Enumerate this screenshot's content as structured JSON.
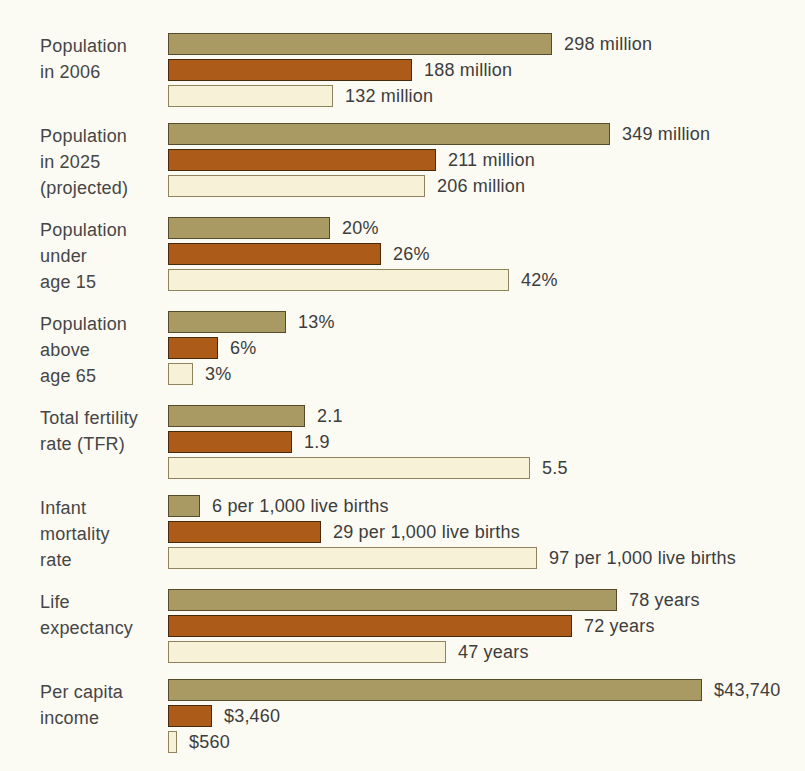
{
  "page": {
    "background_color": "#fbfaf3",
    "text_color": "#414141"
  },
  "series_styles": {
    "olive": {
      "fill": "#a89a62",
      "border": "#564b2b"
    },
    "brown": {
      "fill": "#ac5c18",
      "border": "#472a0c"
    },
    "cream": {
      "fill": "#f7f1d8",
      "border": "#8f835c"
    }
  },
  "chart_data": {
    "type": "bar",
    "orientation": "horizontal",
    "title": "",
    "legend_position": "none",
    "grid": false,
    "axes": "none (values shown as data labels at bar ends)",
    "categories": [
      "Population in 2006",
      "Population in 2025 (projected)",
      "Population under age 15",
      "Population above age 65",
      "Total fertility rate (TFR)",
      "Infant mortality rate",
      "Life expectancy",
      "Per capita income"
    ],
    "series": [
      {
        "name": "olive",
        "color": "#a89a62",
        "values": [
          298,
          349,
          20,
          13,
          2.1,
          6,
          78,
          43740
        ]
      },
      {
        "name": "brown",
        "color": "#ac5c18",
        "values": [
          188,
          211,
          26,
          6,
          1.9,
          29,
          72,
          3460
        ]
      },
      {
        "name": "cream",
        "color": "#f7f1d8",
        "values": [
          132,
          206,
          42,
          3,
          5.5,
          97,
          47,
          560
        ]
      }
    ],
    "groups": [
      {
        "label_lines": [
          "Population",
          "in 2006"
        ],
        "bars": [
          {
            "series": "olive",
            "value": 298,
            "label": "298 million",
            "width_px": 384
          },
          {
            "series": "brown",
            "value": 188,
            "label": "188 million",
            "width_px": 244
          },
          {
            "series": "cream",
            "value": 132,
            "label": "132 million",
            "width_px": 165
          }
        ]
      },
      {
        "label_lines": [
          "Population",
          "in 2025",
          "(projected)"
        ],
        "bars": [
          {
            "series": "olive",
            "value": 349,
            "label": "349 million",
            "width_px": 442
          },
          {
            "series": "brown",
            "value": 211,
            "label": "211 million",
            "width_px": 268
          },
          {
            "series": "cream",
            "value": 206,
            "label": "206 million",
            "width_px": 257
          }
        ]
      },
      {
        "label_lines": [
          "Population",
          "under",
          "age 15"
        ],
        "bars": [
          {
            "series": "olive",
            "value": 20,
            "label": "20%",
            "width_px": 162
          },
          {
            "series": "brown",
            "value": 26,
            "label": "26%",
            "width_px": 213
          },
          {
            "series": "cream",
            "value": 42,
            "label": "42%",
            "width_px": 341
          }
        ]
      },
      {
        "label_lines": [
          "Population",
          "above",
          "age 65"
        ],
        "bars": [
          {
            "series": "olive",
            "value": 13,
            "label": "13%",
            "width_px": 118
          },
          {
            "series": "brown",
            "value": 6,
            "label": "6%",
            "width_px": 50
          },
          {
            "series": "cream",
            "value": 3,
            "label": "3%",
            "width_px": 25
          }
        ]
      },
      {
        "label_lines": [
          "Total fertility",
          "rate (TFR)"
        ],
        "bars": [
          {
            "series": "olive",
            "value": 2.1,
            "label": "2.1",
            "width_px": 137
          },
          {
            "series": "brown",
            "value": 1.9,
            "label": "1.9",
            "width_px": 124
          },
          {
            "series": "cream",
            "value": 5.5,
            "label": "5.5",
            "width_px": 362
          }
        ]
      },
      {
        "label_lines": [
          "Infant",
          "mortality",
          "rate"
        ],
        "bars": [
          {
            "series": "olive",
            "value": 6,
            "label": "6 per 1,000 live births",
            "width_px": 32
          },
          {
            "series": "brown",
            "value": 29,
            "label": "29 per 1,000 live births",
            "width_px": 153
          },
          {
            "series": "cream",
            "value": 97,
            "label": "97 per 1,000 live births",
            "width_px": 369
          }
        ]
      },
      {
        "label_lines": [
          "Life",
          "expectancy"
        ],
        "bars": [
          {
            "series": "olive",
            "value": 78,
            "label": "78 years",
            "width_px": 449
          },
          {
            "series": "brown",
            "value": 72,
            "label": "72 years",
            "width_px": 404
          },
          {
            "series": "cream",
            "value": 47,
            "label": "47 years",
            "width_px": 278
          }
        ]
      },
      {
        "label_lines": [
          "Per capita",
          "income"
        ],
        "bars": [
          {
            "series": "olive",
            "value": 43740,
            "label": "$43,740",
            "width_px": 534
          },
          {
            "series": "brown",
            "value": 3460,
            "label": "$3,460",
            "width_px": 44
          },
          {
            "series": "cream",
            "value": 560,
            "label": "$560",
            "width_px": 9
          }
        ]
      }
    ]
  }
}
